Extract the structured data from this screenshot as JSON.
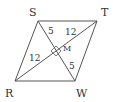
{
  "figure": {
    "shape": "rhombus",
    "vertices": {
      "S": {
        "label": "S",
        "x": 38,
        "y": 21
      },
      "T": {
        "label": "T",
        "x": 97,
        "y": 21
      },
      "W": {
        "label": "W",
        "x": 75,
        "y": 81
      },
      "R": {
        "label": "R",
        "x": 15,
        "y": 81
      }
    },
    "center": {
      "label": "M",
      "x": 56,
      "y": 51
    },
    "segments": {
      "SM": "5",
      "MT": "12",
      "RM": "12",
      "MW": "5"
    },
    "right_angle_marker": true,
    "colors": {
      "stroke": "#555555",
      "text": "#333333",
      "background": "#ffffff"
    }
  }
}
